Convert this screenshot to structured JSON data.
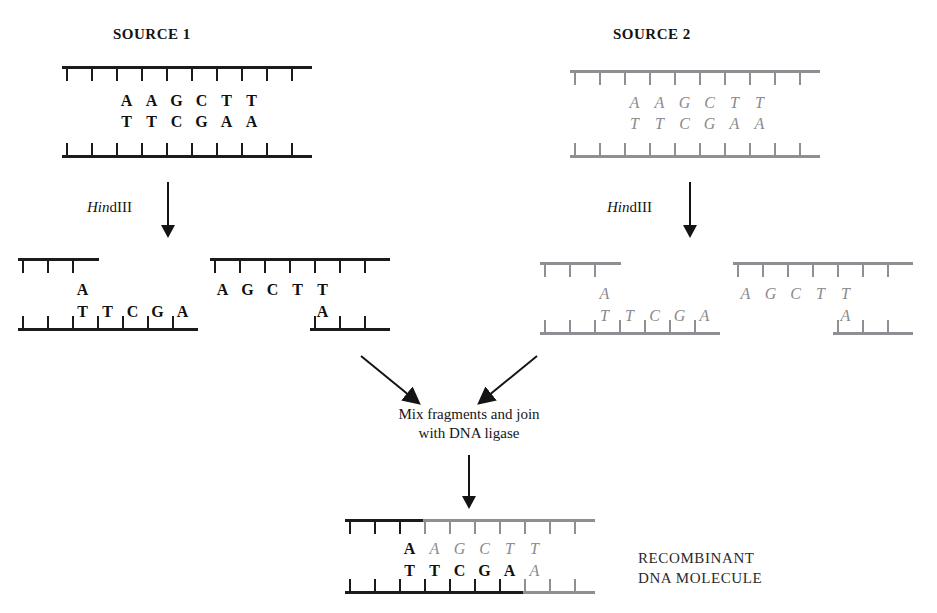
{
  "figure": {
    "sources": [
      {
        "title": "SOURCE 1",
        "style": "black"
      },
      {
        "title": "SOURCE 2",
        "style": "gray"
      }
    ],
    "enzyme": {
      "italic_part": "Hin",
      "upright_part": "dIII",
      "full": "HindIII"
    },
    "source1_duplex": {
      "top_bases": [
        "A",
        "A",
        "G",
        "C",
        "T",
        "T"
      ],
      "bottom_bases": [
        "T",
        "T",
        "C",
        "G",
        "A",
        "A"
      ]
    },
    "source2_duplex": {
      "top_bases": [
        "A",
        "A",
        "G",
        "C",
        "T",
        "T"
      ],
      "bottom_bases": [
        "T",
        "T",
        "C",
        "G",
        "A",
        "A"
      ]
    },
    "source1_left_fragment": {
      "top_bases": [
        "A"
      ],
      "bottom_bases": [
        "T",
        "T",
        "C",
        "G",
        "A"
      ]
    },
    "source1_right_fragment": {
      "top_bases": [
        "A",
        "G",
        "C",
        "T",
        "T"
      ],
      "bottom_bases": [
        "A"
      ]
    },
    "source2_left_fragment": {
      "top_bases": [
        "A"
      ],
      "bottom_bases": [
        "T",
        "T",
        "C",
        "G",
        "A"
      ]
    },
    "source2_right_fragment": {
      "top_bases": [
        "A",
        "G",
        "C",
        "T",
        "T"
      ],
      "bottom_bases": [
        "A"
      ]
    },
    "mix_caption_line1": "Mix fragments and join",
    "mix_caption_line2": "with DNA ligase",
    "recombinant": {
      "top_black_bases": [
        "A"
      ],
      "top_gray_bases": [
        "A",
        "G",
        "C",
        "T",
        "T"
      ],
      "bottom_black_bases": [
        "T",
        "T",
        "C",
        "G",
        "A"
      ],
      "bottom_gray_bases": [
        "A"
      ],
      "label_line1": "RECOMBINANT",
      "label_line2": "DNA MOLECULE"
    },
    "colors": {
      "black_strand": "#1b1b1b",
      "gray_strand": "#8e8e93",
      "black_text": "#101010",
      "gray_text": "#8a8a8e"
    }
  }
}
